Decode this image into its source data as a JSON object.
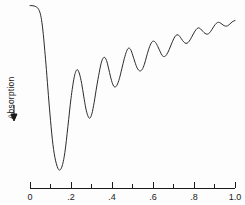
{
  "chart_data": {
    "type": "line",
    "title": "",
    "subtitle": "",
    "xlabel": "",
    "ylabel": "Absorption",
    "ylabel_arrow": "downward-arrow",
    "xlim": [
      0.0,
      1.0
    ],
    "ylim": [
      0.0,
      1.0
    ],
    "grid": false,
    "legend": null,
    "axis_style": "x-axis-only-ticks-below",
    "y_axis_direction": "absorption-increases-downward",
    "x_major_ticks": [
      0.0,
      0.2,
      0.4,
      0.6,
      0.8,
      1.0
    ],
    "x_major_tick_labels": [
      "0",
      ".2",
      ".4",
      ".6",
      ".8",
      "1.0"
    ],
    "x_minor_ticks": [
      0.1,
      0.3,
      0.5,
      0.7,
      0.9
    ],
    "series": [
      {
        "name": "absorption",
        "color": "#2b2b2b",
        "x": [
          0.0,
          0.01,
          0.02,
          0.03,
          0.04,
          0.05,
          0.058,
          0.065,
          0.072,
          0.08,
          0.09,
          0.1,
          0.112,
          0.125,
          0.14,
          0.155,
          0.17,
          0.185,
          0.2,
          0.215,
          0.228,
          0.24,
          0.252,
          0.262,
          0.272,
          0.282,
          0.292,
          0.302,
          0.313,
          0.325,
          0.338,
          0.35,
          0.362,
          0.373,
          0.383,
          0.393,
          0.403,
          0.413,
          0.424,
          0.436,
          0.448,
          0.46,
          0.471,
          0.481,
          0.491,
          0.501,
          0.512,
          0.523,
          0.535,
          0.547,
          0.558,
          0.568,
          0.578,
          0.589,
          0.6,
          0.612,
          0.624,
          0.635,
          0.645,
          0.656,
          0.667,
          0.679,
          0.69,
          0.701,
          0.711,
          0.722,
          0.733,
          0.744,
          0.755,
          0.766,
          0.777,
          0.788,
          0.799,
          0.81,
          0.821,
          0.832,
          0.843,
          0.854,
          0.865,
          0.876,
          0.887,
          0.898,
          0.909,
          0.92,
          0.931,
          0.942,
          0.953,
          0.964,
          0.975,
          0.986,
          1.0
        ],
        "y": [
          0.985,
          0.985,
          0.983,
          0.978,
          0.968,
          0.94,
          0.89,
          0.82,
          0.73,
          0.62,
          0.47,
          0.33,
          0.19,
          0.098,
          0.048,
          0.062,
          0.145,
          0.295,
          0.455,
          0.572,
          0.618,
          0.6,
          0.54,
          0.468,
          0.4,
          0.356,
          0.342,
          0.368,
          0.432,
          0.52,
          0.605,
          0.668,
          0.69,
          0.672,
          0.628,
          0.578,
          0.538,
          0.52,
          0.53,
          0.568,
          0.625,
          0.682,
          0.724,
          0.742,
          0.734,
          0.702,
          0.662,
          0.628,
          0.612,
          0.62,
          0.65,
          0.692,
          0.732,
          0.766,
          0.782,
          0.775,
          0.75,
          0.722,
          0.7,
          0.694,
          0.706,
          0.734,
          0.766,
          0.795,
          0.814,
          0.818,
          0.805,
          0.786,
          0.772,
          0.77,
          0.782,
          0.804,
          0.828,
          0.848,
          0.858,
          0.852,
          0.838,
          0.826,
          0.822,
          0.83,
          0.848,
          0.868,
          0.884,
          0.89,
          0.884,
          0.874,
          0.868,
          0.87,
          0.88,
          0.892,
          0.9
        ]
      }
    ],
    "annotations": []
  },
  "axis": {
    "tick_labels": [
      "0",
      ".2",
      ".4",
      ".6",
      ".8",
      "1.0"
    ],
    "y_axis_label": "Absorption"
  },
  "colors": {
    "background": "#fdfdfd",
    "curve": "#2b2b2b",
    "axis": "#1a1a1a",
    "text": "#1a1a1a"
  }
}
